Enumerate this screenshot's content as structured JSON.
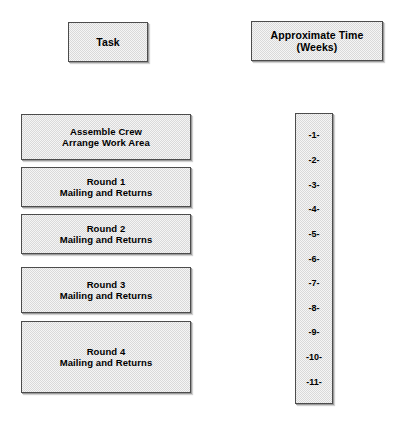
{
  "diagram": {
    "title_columns": [
      {
        "id": "task",
        "label": "Task"
      },
      {
        "id": "approximate-time",
        "label_line1": "Approximate Time",
        "label_line2": "(Weeks)"
      }
    ],
    "tasks": [
      {
        "id": "assemble-crew",
        "line1": "Assemble Crew",
        "line2": "Arrange Work Area"
      },
      {
        "id": "round-1",
        "line1": "Round 1",
        "line2": "Mailing and Returns"
      },
      {
        "id": "round-2",
        "line1": "Round 2",
        "line2": "Mailing and Returns"
      },
      {
        "id": "round-3",
        "line1": "Round 3",
        "line2": "Mailing and Returns"
      },
      {
        "id": "round-4",
        "line1": "Round 4",
        "line2": "Mailing and Returns"
      }
    ],
    "weeks": [
      "-1-",
      "-2-",
      "-3-",
      "-4-",
      "-5-",
      "-6-",
      "-7-",
      "-8-",
      "-9-",
      "-10-",
      "-11-"
    ],
    "colors": {
      "background": "#ffffff",
      "box_fill": "#d9d9d9",
      "box_border": "#4c4c4c",
      "text": "#000000"
    }
  }
}
